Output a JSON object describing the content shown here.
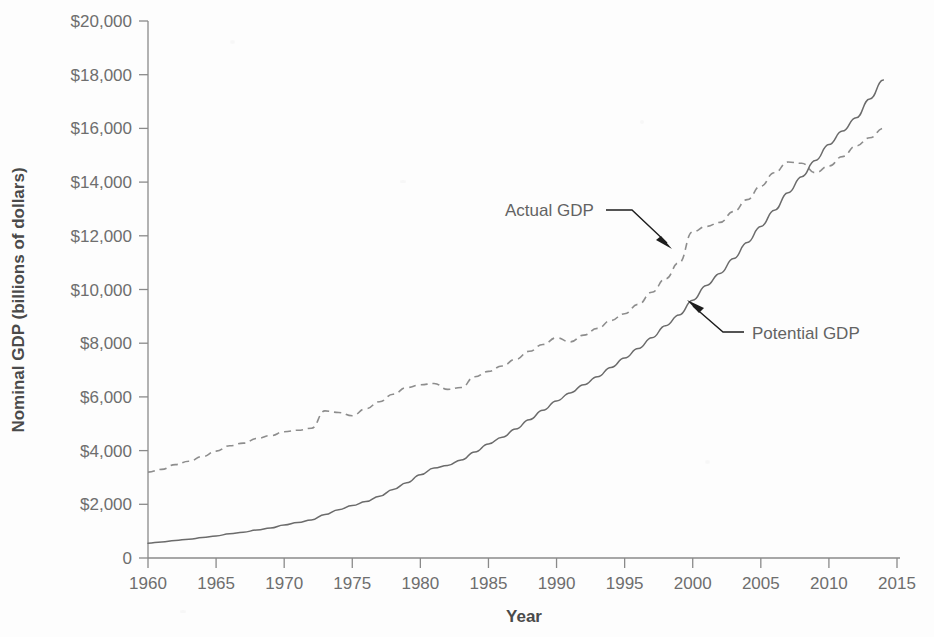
{
  "chart_data": {
    "type": "line",
    "title": "",
    "xlabel": "Year",
    "ylabel": "Nominal GDP (billions of dollars)",
    "xlim": [
      1960,
      2015
    ],
    "ylim": [
      0,
      20000
    ],
    "grid": false,
    "legend_position": "inline-annotations",
    "xticks": [
      "1960",
      "1965",
      "1970",
      "1975",
      "1980",
      "1985",
      "1990",
      "1995",
      "2000",
      "2005",
      "2010",
      "2015"
    ],
    "yticks": [
      "0",
      "$2,000",
      "$4,000",
      "$6,000",
      "$8,000",
      "$10,000",
      "$12,000",
      "$14,000",
      "$16,000",
      "$18,000",
      "$20,000"
    ],
    "x": [
      1960,
      1961,
      1962,
      1963,
      1964,
      1965,
      1966,
      1967,
      1968,
      1969,
      1970,
      1971,
      1972,
      1973,
      1974,
      1975,
      1976,
      1977,
      1978,
      1979,
      1980,
      1981,
      1982,
      1983,
      1984,
      1985,
      1986,
      1987,
      1988,
      1989,
      1990,
      1991,
      1992,
      1993,
      1994,
      1995,
      1996,
      1997,
      1998,
      1999,
      2000,
      2001,
      2002,
      2003,
      2004,
      2005,
      2006,
      2007,
      2008,
      2009,
      2010,
      2011,
      2012,
      2013,
      2014
    ],
    "series": [
      {
        "name": "Actual GDP",
        "style": "dashed",
        "color": "#8d8d8d",
        "values": [
          3200,
          3300,
          3480,
          3600,
          3780,
          3980,
          4180,
          4280,
          4450,
          4560,
          4700,
          4760,
          4830,
          5480,
          5420,
          5300,
          5560,
          5820,
          6100,
          6350,
          6450,
          6500,
          6280,
          6350,
          6750,
          6950,
          7150,
          7400,
          7700,
          7950,
          8200,
          8050,
          8300,
          8550,
          8850,
          9100,
          9450,
          9900,
          10400,
          11000,
          12150,
          12350,
          12500,
          12900,
          13350,
          13850,
          14350,
          14750,
          14700,
          14350,
          14600,
          14950,
          15350,
          15650,
          16000
        ]
      },
      {
        "name": "Potential GDP",
        "style": "solid",
        "color": "#6b6b6b",
        "values": [
          550,
          600,
          650,
          700,
          760,
          820,
          900,
          960,
          1040,
          1120,
          1230,
          1320,
          1420,
          1620,
          1800,
          1950,
          2100,
          2300,
          2550,
          2800,
          3100,
          3350,
          3450,
          3650,
          3950,
          4250,
          4500,
          4800,
          5150,
          5500,
          5850,
          6150,
          6450,
          6750,
          7100,
          7450,
          7800,
          8200,
          8650,
          9050,
          9600,
          10150,
          10600,
          11150,
          11750,
          12350,
          12950,
          13600,
          14200,
          14800,
          15400,
          15900,
          16400,
          17100,
          17800
        ]
      }
    ],
    "annotations": [
      {
        "text": "Actual GDP",
        "target_year": 1999,
        "target_value": 11300
      },
      {
        "text": "Potential GDP",
        "target_year": 2000,
        "target_value": 9550
      }
    ]
  }
}
